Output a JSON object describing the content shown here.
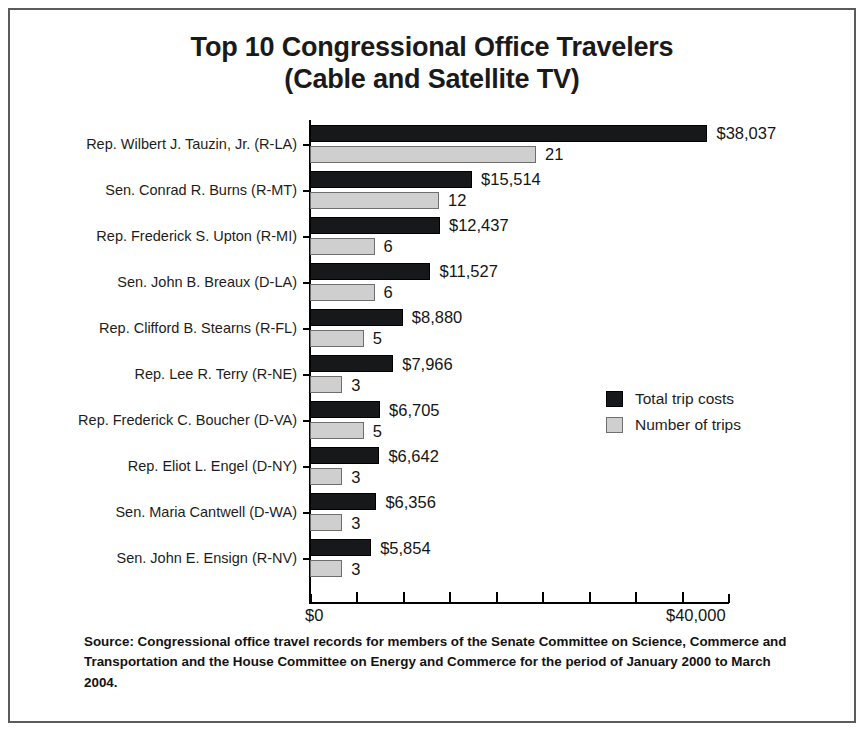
{
  "chart_data": {
    "type": "bar",
    "orientation": "horizontal",
    "title": "Top 10 Congressional Office Travelers",
    "subtitle": "(Cable and Satellite TV)",
    "title_lines": [
      "Top 10 Congressional Office Travelers",
      "(Cable and Satellite TV)"
    ],
    "xlabel": "",
    "ylabel": "",
    "xlim": [
      0,
      40000
    ],
    "xtick_labels": [
      "$0",
      "$40,000"
    ],
    "xtick_values": [
      0,
      40000
    ],
    "xtick_minor_count": 8,
    "xtick_minor_step": 4000,
    "grid": false,
    "legend_position": "center-right",
    "categories": [
      "Rep. Wilbert J. Tauzin, Jr. (R-LA)",
      "Sen. Conrad R. Burns (R-MT)",
      "Rep. Frederick S. Upton (R-MI)",
      "Sen. John B. Breaux (D-LA)",
      "Rep. Clifford B. Stearns (R-FL)",
      "Rep. Lee R. Terry (R-NE)",
      "Rep. Frederick C. Boucher (D-VA)",
      "Rep. Eliot L. Engel (D-NY)",
      "Sen. Maria Cantwell (D-WA)",
      "Sen. John E. Ensign (R-NV)"
    ],
    "series": [
      {
        "name": "Total trip costs",
        "color": "#17181a",
        "values": [
          38037,
          15514,
          12437,
          11527,
          8880,
          7966,
          6705,
          6642,
          6356,
          5854
        ],
        "labels": [
          "$38,037",
          "$15,514",
          "$12,437",
          "$11,527",
          "$8,880",
          "$7,966",
          "$6,705",
          "$6,642",
          "$6,356",
          "$5,854"
        ]
      },
      {
        "name": "Number of trips",
        "color": "#cfcfcf",
        "values": [
          21,
          12,
          6,
          6,
          5,
          3,
          5,
          3,
          3,
          3
        ],
        "labels": [
          "21",
          "12",
          "6",
          "6",
          "5",
          "3",
          "5",
          "3",
          "3",
          "3"
        ]
      }
    ],
    "source_note": "Source: Congressional office travel records for members of the Senate Committee on Science, Commerce and Transportation and the House Committee on Energy and Commerce for the period of January 2000 to March 2004."
  },
  "legend": {
    "items": [
      {
        "label": "Total trip costs",
        "color": "#17181a"
      },
      {
        "label": "Number of trips",
        "color": "#cfcfcf"
      }
    ]
  },
  "axis": {
    "x_min_label": "$0",
    "x_max_label": "$40,000"
  }
}
